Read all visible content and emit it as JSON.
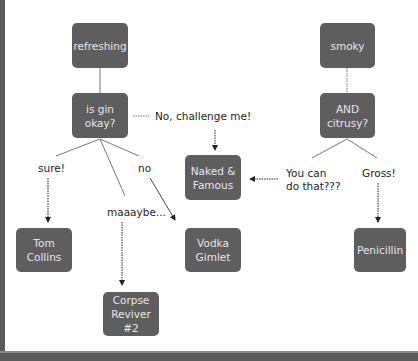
{
  "diagram": {
    "nodes": [
      {
        "id": "refreshing",
        "label": "refreshing"
      },
      {
        "id": "is-gin-okay",
        "label": "is gin\nokay?"
      },
      {
        "id": "smoky",
        "label": "smoky"
      },
      {
        "id": "and-citrusy",
        "label": "AND\ncitrusy?"
      },
      {
        "id": "naked-famous",
        "label": "Naked &\nFamous"
      },
      {
        "id": "tom-collins",
        "label": "Tom\nCollins"
      },
      {
        "id": "vodka-gimlet",
        "label": "Vodka\nGimlet"
      },
      {
        "id": "corpse-reviver",
        "label": "Corpse\nReviver #2"
      },
      {
        "id": "penicillin",
        "label": "Penicillin"
      }
    ],
    "edge_labels": {
      "challenge": "No, challenge me!",
      "sure": "sure!",
      "no": "no",
      "maybe": "maaaybe...",
      "you_can": "You can\ndo that???",
      "gross": "Gross!"
    },
    "colors": {
      "node_fill": "#5e5e5e",
      "node_text": "#e6e6e6",
      "edge": "#555555",
      "frame": "#5a5a5a"
    }
  }
}
